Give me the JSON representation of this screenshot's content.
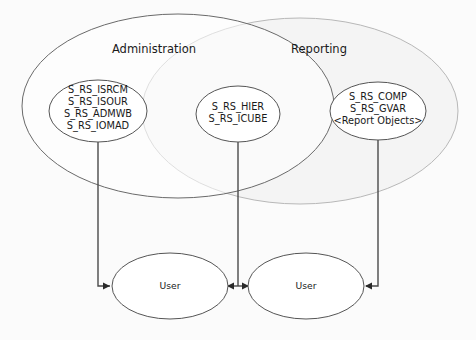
{
  "diagram": {
    "type": "venn-authorization-diagram",
    "background_color": "#fbfbfb",
    "sets": [
      {
        "id": "administration",
        "label": "Administration",
        "stroke_color": "#646464",
        "fill_color": "#fdfdfd"
      },
      {
        "id": "reporting",
        "label": "Reporting",
        "stroke_color": "#b4b4b4",
        "fill_color": "#f5f5f5"
      }
    ],
    "nodes": [
      {
        "id": "admin-objects",
        "lines": [
          "S_RS_ISRCM",
          "S_RS_ISOUR",
          "S_RS_ADMWB",
          "S_RS_IOMAD"
        ],
        "stroke_color": "#555555"
      },
      {
        "id": "shared-objects",
        "lines": [
          "S_RS_HIER",
          "S_RS_ICUBE"
        ],
        "stroke_color": "#555555"
      },
      {
        "id": "reporting-objects",
        "lines": [
          "S_RS_COMP",
          "S_RS_GVAR",
          "<Report Objects>"
        ],
        "stroke_color": "#555555"
      }
    ],
    "users": [
      {
        "id": "user-left",
        "label": "User",
        "stroke_color": "#555555"
      },
      {
        "id": "user-right",
        "label": "User",
        "stroke_color": "#555555"
      }
    ],
    "connectors": [
      {
        "id": "admin-to-user-left",
        "from": "admin-objects",
        "to": "user-left",
        "arrow": "single"
      },
      {
        "id": "shared-to-both-users",
        "from": "shared-objects",
        "to": "user-left,user-right",
        "arrow": "double"
      },
      {
        "id": "reporting-to-user-right",
        "from": "reporting-objects",
        "to": "user-right",
        "arrow": "single"
      }
    ],
    "line_color": "#4a4a4a"
  }
}
